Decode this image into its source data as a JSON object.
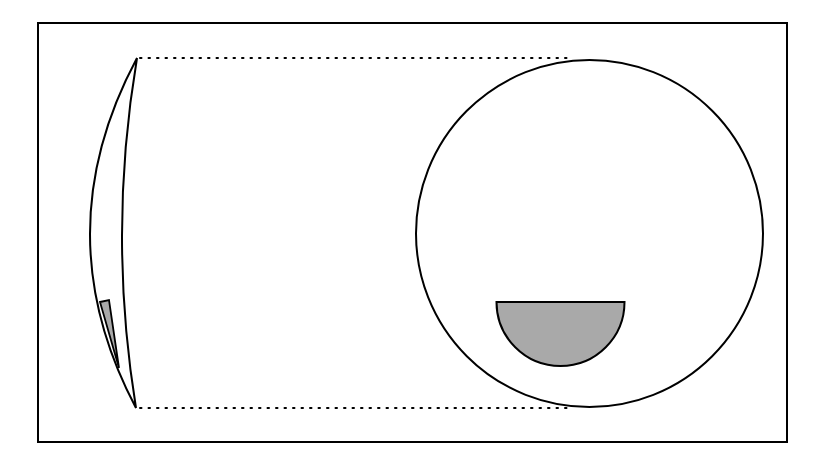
{
  "diagram": {
    "type": "optics-schematic",
    "colors": {
      "stroke": "#000000",
      "fill_shaded": "#a9a9a9",
      "background": "#ffffff"
    },
    "frame": {
      "x": 38,
      "y": 23,
      "width": 749,
      "height": 419
    },
    "lens": {
      "top": [
        137,
        58
      ],
      "bottom": [
        136,
        408
      ],
      "left_curve_mid_x": 90,
      "right_curve_mid_x": 122
    },
    "lens_shaded_wedge": {
      "points": [
        [
          100,
          302
        ],
        [
          109,
          300
        ],
        [
          119,
          368
        ]
      ]
    },
    "circle": {
      "cx": 589.5,
      "cy": 233.5,
      "r": 173.5
    },
    "half_disk": {
      "cx": 560.5,
      "cy": 302,
      "r": 64,
      "orientation": "lower-half"
    },
    "projection_lines": [
      {
        "from": [
          140,
          58
        ],
        "to": [
          572,
          58
        ],
        "style": "dotted"
      },
      {
        "from": [
          140,
          408
        ],
        "to": [
          572,
          408
        ],
        "style": "dotted"
      }
    ]
  }
}
